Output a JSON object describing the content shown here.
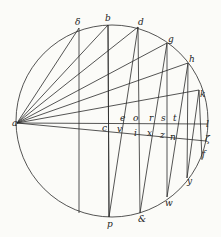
{
  "diagram": {
    "type": "geometric-construction",
    "circle": {
      "cx": 112,
      "cy": 121,
      "r": 96
    },
    "labels": {
      "a": "a",
      "delta": "δ",
      "b": "b",
      "d": "d",
      "g": "g",
      "h": "h",
      "k": "k",
      "l": "l",
      "zeta": "ζ",
      "f": "f",
      "y": "y",
      "w": "w",
      "amp": "&",
      "p": "p",
      "c": "c",
      "e": "e",
      "o": "o",
      "r": "r",
      "s": "s",
      "t": "t",
      "v": "v",
      "i": "i",
      "x": "x",
      "z": "z",
      "n": "n"
    }
  }
}
